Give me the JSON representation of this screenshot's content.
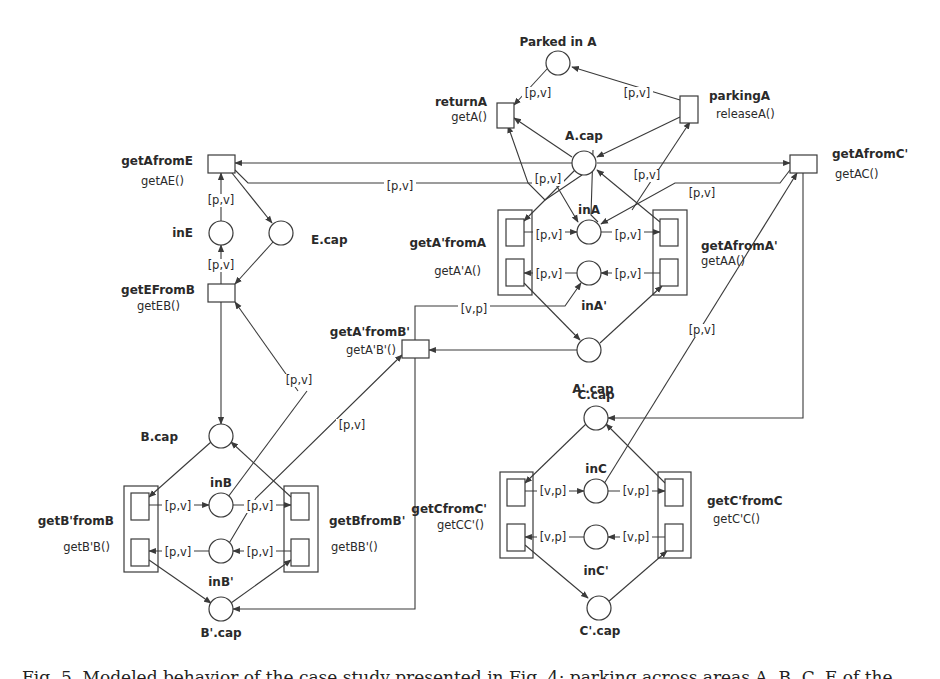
{
  "figure": {
    "caption": "Fig. 5. Modeled behavior of the case study presented in Fig. 4: parking across areas A, B, C, E of the",
    "colors": {
      "stroke": "#3a3a3a",
      "text": "#2a2a2a",
      "background": "#ffffff"
    }
  },
  "places": [
    {
      "id": "parkedA",
      "label": "Parked in A",
      "cx": 558,
      "cy": 63,
      "lx": 558,
      "ly": 46,
      "anchor": "middle"
    },
    {
      "id": "Acap",
      "label": "A.cap",
      "cx": 584,
      "cy": 163,
      "lx": 584,
      "ly": 140,
      "anchor": "middle"
    },
    {
      "id": "inA",
      "label": "inA",
      "cx": 589,
      "cy": 232,
      "lx": 589,
      "ly": 214,
      "anchor": "middle"
    },
    {
      "id": "inAp",
      "label": "inA'",
      "cx": 589,
      "cy": 273,
      "lx": 594,
      "ly": 310,
      "anchor": "middle"
    },
    {
      "id": "Apcap",
      "label": "A'.cap",
      "cx": 589,
      "cy": 350,
      "lx": 593,
      "ly": 393,
      "anchor": "middle"
    },
    {
      "id": "inE",
      "label": "inE",
      "cx": 221,
      "cy": 233,
      "lx": 193,
      "ly": 237,
      "anchor": "end"
    },
    {
      "id": "Ecap",
      "label": "E.cap",
      "cx": 281,
      "cy": 233,
      "lx": 311,
      "ly": 244,
      "anchor": "start"
    },
    {
      "id": "Bcap",
      "label": "B.cap",
      "cx": 221,
      "cy": 436,
      "lx": 178,
      "ly": 441,
      "anchor": "end"
    },
    {
      "id": "inB",
      "label": "inB",
      "cx": 221,
      "cy": 505,
      "lx": 221,
      "ly": 487,
      "anchor": "middle"
    },
    {
      "id": "inBp",
      "label": "inB'",
      "cx": 221,
      "cy": 551,
      "lx": 221,
      "ly": 586,
      "anchor": "middle"
    },
    {
      "id": "Bpcap",
      "label": "B'.cap",
      "cx": 221,
      "cy": 609,
      "lx": 221,
      "ly": 637,
      "anchor": "middle"
    },
    {
      "id": "Ccap",
      "label": "C.cap",
      "cx": 596,
      "cy": 418,
      "lx": 596,
      "ly": 399,
      "anchor": "middle"
    },
    {
      "id": "inC",
      "label": "inC",
      "cx": 596,
      "cy": 491,
      "lx": 596,
      "ly": 473,
      "anchor": "middle"
    },
    {
      "id": "inCp",
      "label": "inC'",
      "cx": 596,
      "cy": 537,
      "lx": 596,
      "ly": 575,
      "anchor": "middle"
    },
    {
      "id": "Cpcap",
      "label": "C'.cap",
      "cx": 599,
      "cy": 608,
      "lx": 600,
      "ly": 635,
      "anchor": "middle"
    }
  ],
  "transitions": [
    {
      "id": "returnA",
      "name": "returnA",
      "method": "getA()",
      "x": 497,
      "y": 103,
      "w": 17,
      "h": 25,
      "lx": 487,
      "ly": 106,
      "mx": 487,
      "my": 121,
      "anchor": "end"
    },
    {
      "id": "parkingA",
      "name": "parkingA",
      "method": "releaseA()",
      "x": 680,
      "y": 96,
      "w": 18,
      "h": 27,
      "lx": 709,
      "ly": 100,
      "mx": 716,
      "my": 118,
      "anchor": "start"
    },
    {
      "id": "getAfromE",
      "name": "getAfromE",
      "method": "getAE()",
      "x": 208,
      "y": 155,
      "w": 27,
      "h": 18,
      "lx": 193,
      "ly": 165,
      "mx": 184,
      "my": 185,
      "anchor": "end"
    },
    {
      "id": "getEFromB",
      "name": "getEFromB",
      "method": "getEB()",
      "x": 208,
      "y": 284,
      "w": 27,
      "h": 18,
      "lx": 195,
      "ly": 294,
      "mx": 180,
      "my": 310,
      "anchor": "end"
    },
    {
      "id": "getAfromCp",
      "name": "getAfromC'",
      "method": "getAC()",
      "x": 790,
      "y": 155,
      "w": 27,
      "h": 18,
      "lx": 832,
      "ly": 158,
      "mx": 835,
      "my": 178,
      "anchor": "start"
    },
    {
      "id": "getApfromBp",
      "name": "getA'fromB'",
      "method": "getA'B'()",
      "x": 402,
      "y": 340,
      "w": 27,
      "h": 18,
      "lx": 410,
      "ly": 336,
      "mx": 396,
      "my": 354,
      "anchor": "end"
    }
  ],
  "groups": [
    {
      "id": "getApfromA",
      "name": "getA'fromA",
      "method": "getA'A()",
      "x": 498,
      "y": 210,
      "w": 34,
      "h": 85,
      "lx": 486,
      "ly": 247,
      "mx": 481,
      "my": 275,
      "anchor": "end",
      "boxes": [
        {
          "x": 506,
          "y": 219,
          "w": 18,
          "h": 27
        },
        {
          "x": 506,
          "y": 259,
          "w": 18,
          "h": 27
        }
      ]
    },
    {
      "id": "getAfromAp",
      "name": "getAfromA'",
      "method": "getAA()",
      "x": 653,
      "y": 210,
      "w": 34,
      "h": 85,
      "lx": 701,
      "ly": 250,
      "mx": 701,
      "my": 265,
      "anchor": "start",
      "boxes": [
        {
          "x": 660,
          "y": 219,
          "w": 18,
          "h": 27
        },
        {
          "x": 660,
          "y": 259,
          "w": 18,
          "h": 27
        }
      ]
    },
    {
      "id": "getBpfromB",
      "name": "getB'fromB",
      "method": "getB'B()",
      "x": 124,
      "y": 486,
      "w": 34,
      "h": 86,
      "lx": 114,
      "ly": 525,
      "mx": 110,
      "my": 551,
      "anchor": "end",
      "boxes": [
        {
          "x": 131,
          "y": 493,
          "w": 18,
          "h": 27
        },
        {
          "x": 131,
          "y": 539,
          "w": 18,
          "h": 27
        }
      ]
    },
    {
      "id": "getBfromBp",
      "name": "getBfromB'",
      "method": "getBB'()",
      "x": 284,
      "y": 486,
      "w": 34,
      "h": 86,
      "lx": 329,
      "ly": 525,
      "mx": 331,
      "my": 551,
      "anchor": "start",
      "boxes": [
        {
          "x": 291,
          "y": 493,
          "w": 18,
          "h": 27
        },
        {
          "x": 291,
          "y": 539,
          "w": 18,
          "h": 27
        }
      ]
    },
    {
      "id": "getCfromCp",
      "name": "getCfromC'",
      "method": "getCC'()",
      "x": 500,
      "y": 472,
      "w": 33,
      "h": 86,
      "lx": 487,
      "ly": 513,
      "mx": 484,
      "my": 529,
      "anchor": "end",
      "boxes": [
        {
          "x": 507,
          "y": 479,
          "w": 18,
          "h": 27
        },
        {
          "x": 507,
          "y": 524,
          "w": 18,
          "h": 27
        }
      ]
    },
    {
      "id": "getCpfromC",
      "name": "getC'fromC",
      "method": "getC'C()",
      "x": 658,
      "y": 472,
      "w": 33,
      "h": 86,
      "lx": 707,
      "ly": 505,
      "mx": 713,
      "my": 523,
      "anchor": "start",
      "boxes": [
        {
          "x": 665,
          "y": 479,
          "w": 18,
          "h": 27
        },
        {
          "x": 665,
          "y": 524,
          "w": 18,
          "h": 27
        }
      ]
    }
  ],
  "arc_labels": [
    {
      "text": "[p,v]",
      "x": 538,
      "y": 97
    },
    {
      "text": "[p,v]",
      "x": 637,
      "y": 97
    },
    {
      "text": "[p,v]",
      "x": 548,
      "y": 183
    },
    {
      "text": "[p,v]",
      "x": 647,
      "y": 179
    },
    {
      "text": "[p,v]",
      "x": 702,
      "y": 197
    },
    {
      "text": "[p,v]",
      "x": 400,
      "y": 190
    },
    {
      "text": "[p,v]",
      "x": 221,
      "y": 204
    },
    {
      "text": "[p,v]",
      "x": 221,
      "y": 269
    },
    {
      "text": "[p,v]",
      "x": 549,
      "y": 239
    },
    {
      "text": "[p,v]",
      "x": 628,
      "y": 239
    },
    {
      "text": "[p,v]",
      "x": 549,
      "y": 278
    },
    {
      "text": "[p,v]",
      "x": 628,
      "y": 278
    },
    {
      "text": "[v,p]",
      "x": 474,
      "y": 313
    },
    {
      "text": "[p,v]",
      "x": 702,
      "y": 334
    },
    {
      "text": "[p,v]",
      "x": 299,
      "y": 384
    },
    {
      "text": "[p,v]",
      "x": 352,
      "y": 429
    },
    {
      "text": "[p,v]",
      "x": 178,
      "y": 510
    },
    {
      "text": "[p,v]",
      "x": 260,
      "y": 510
    },
    {
      "text": "[p,v]",
      "x": 178,
      "y": 556
    },
    {
      "text": "[p,v]",
      "x": 260,
      "y": 556
    },
    {
      "text": "[v,p]",
      "x": 553,
      "y": 495
    },
    {
      "text": "[v,p]",
      "x": 636,
      "y": 495
    },
    {
      "text": "[v,p]",
      "x": 553,
      "y": 541
    },
    {
      "text": "[v,p]",
      "x": 636,
      "y": 541
    }
  ],
  "arcs": [
    {
      "d": "M547,69 L514,105",
      "arrow": true
    },
    {
      "d": "M680,100 L572,67",
      "arrow": true
    },
    {
      "d": "M572,157 L514,118",
      "arrow": true
    },
    {
      "d": "M582,175 L545,200 L528,183 L508,126",
      "arrow": true
    },
    {
      "d": "M680,117 L597,157",
      "arrow": true
    },
    {
      "d": "M632,210 L690,122",
      "arrow": true
    },
    {
      "d": "M572,163 L235,163",
      "arrow": true
    },
    {
      "d": "M597,163 L790,163",
      "arrow": true
    },
    {
      "d": "M235,170 L248,183 L555,183 L578,222",
      "arrow": true
    },
    {
      "d": "M790,170 L780,183 L675,183 L601,224",
      "arrow": true
    },
    {
      "d": "M593,150 L591,215 L598,222",
      "arrow": false
    },
    {
      "d": "M575,170 L524,221",
      "arrow": true
    },
    {
      "d": "M660,222 L597,170",
      "arrow": true
    },
    {
      "d": "M524,232 L577,232",
      "arrow": true
    },
    {
      "d": "M601,232 L660,232",
      "arrow": true
    },
    {
      "d": "M577,273 L524,273",
      "arrow": true
    },
    {
      "d": "M660,273 L601,273",
      "arrow": true
    },
    {
      "d": "M524,283 L580,340",
      "arrow": true
    },
    {
      "d": "M600,343 L662,286",
      "arrow": true
    },
    {
      "d": "M577,350 L429,350",
      "arrow": true
    },
    {
      "d": "M415,340 L415,306 L565,306 L581,283",
      "arrow": true
    },
    {
      "d": "M221,221 L221,173",
      "arrow": true
    },
    {
      "d": "M221,284 L221,245",
      "arrow": true
    },
    {
      "d": "M228,168 L272,223",
      "arrow": true
    },
    {
      "d": "M273,242 L235,284",
      "arrow": true
    },
    {
      "d": "M221,302 L221,424",
      "arrow": true
    },
    {
      "d": "M298,391 L235,302",
      "arrow": true
    },
    {
      "d": "M228,497 L307,391",
      "arrow": false
    },
    {
      "d": "M228,545 L256,498 L402,355",
      "arrow": true
    },
    {
      "d": "M415,358 L415,609 L233,609",
      "arrow": true
    },
    {
      "d": "M211,442 L149,497",
      "arrow": true
    },
    {
      "d": "M291,497 L231,442",
      "arrow": true
    },
    {
      "d": "M149,505 L209,505",
      "arrow": true
    },
    {
      "d": "M233,505 L291,505",
      "arrow": true
    },
    {
      "d": "M209,551 L149,551",
      "arrow": true
    },
    {
      "d": "M291,551 L233,551",
      "arrow": true
    },
    {
      "d": "M149,560 L211,603",
      "arrow": true
    },
    {
      "d": "M231,603 L291,560",
      "arrow": true
    },
    {
      "d": "M803,173 L803,418 L608,418",
      "arrow": true
    },
    {
      "d": "M602,487 L797,173",
      "arrow": true
    },
    {
      "d": "M586,424 L525,483",
      "arrow": true
    },
    {
      "d": "M665,483 L606,424",
      "arrow": true
    },
    {
      "d": "M525,491 L584,491",
      "arrow": true
    },
    {
      "d": "M608,491 L665,491",
      "arrow": true
    },
    {
      "d": "M584,537 L525,537",
      "arrow": true
    },
    {
      "d": "M665,537 L608,537",
      "arrow": true
    },
    {
      "d": "M525,545 L588,598",
      "arrow": true
    },
    {
      "d": "M608,602 L667,551",
      "arrow": true
    }
  ]
}
